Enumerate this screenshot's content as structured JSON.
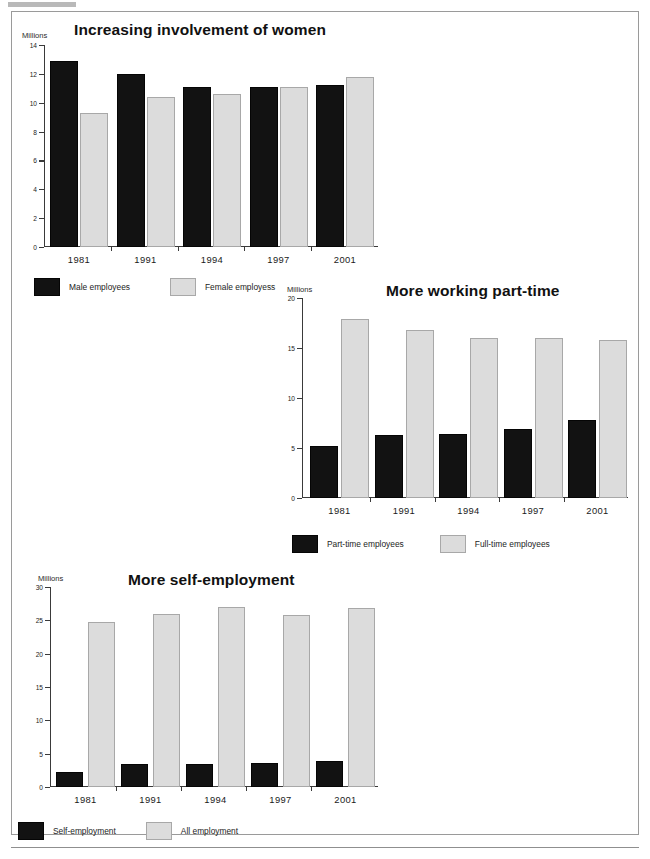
{
  "page": {
    "background_color": "#ffffff",
    "frame_color": "#9a9a9a",
    "dark_series_color": "#121212",
    "light_series_color": "#dcdcdc"
  },
  "charts": [
    {
      "title": "Increasing involvement of women",
      "unit_label": "Millions",
      "legend": [
        {
          "label": "Male employees",
          "swatch": "dark"
        },
        {
          "label": "Female employess",
          "swatch": "light"
        }
      ]
    },
    {
      "title": "More working part-time",
      "unit_label": "Millions",
      "legend": [
        {
          "label": "Part-time employees",
          "swatch": "dark"
        },
        {
          "label": "Full-time employees",
          "swatch": "light"
        }
      ]
    },
    {
      "title": "More self-employment",
      "unit_label": "Millions",
      "legend": [
        {
          "label": "Self-employment",
          "swatch": "dark"
        },
        {
          "label": "All employment",
          "swatch": "light"
        }
      ]
    }
  ],
  "chart_data": [
    {
      "type": "bar",
      "title": "Increasing involvement of women",
      "xlabel": "",
      "ylabel": "Millions",
      "ylim": [
        0,
        14
      ],
      "yticks": [
        0,
        2,
        4,
        6,
        8,
        10,
        12,
        14
      ],
      "ytick_labels": [
        "0",
        "2",
        "4",
        "6",
        "8",
        "10",
        "12",
        "14"
      ],
      "grid": false,
      "legend_position": "below",
      "categories": [
        "1981",
        "1991",
        "1994",
        "1997",
        "2001"
      ],
      "series": [
        {
          "name": "Male employees",
          "color": "#121212",
          "values": [
            12.9,
            12.0,
            11.1,
            11.1,
            11.2
          ]
        },
        {
          "name": "Female employess",
          "color": "#dcdcdc",
          "values": [
            9.3,
            10.4,
            10.6,
            11.1,
            11.8
          ]
        }
      ]
    },
    {
      "type": "bar",
      "title": "More working part-time",
      "xlabel": "",
      "ylabel": "Millions",
      "ylim": [
        0,
        20
      ],
      "yticks": [
        0,
        5,
        10,
        15,
        20
      ],
      "ytick_labels": [
        "0",
        "5",
        "10",
        "15",
        "20"
      ],
      "grid": false,
      "legend_position": "below",
      "categories": [
        "1981",
        "1991",
        "1994",
        "1997",
        "2001"
      ],
      "series": [
        {
          "name": "Part-time employees",
          "color": "#121212",
          "values": [
            5.2,
            6.3,
            6.4,
            6.9,
            7.8
          ]
        },
        {
          "name": "Full-time employees",
          "color": "#dcdcdc",
          "values": [
            17.9,
            16.8,
            16.0,
            16.0,
            15.8
          ]
        }
      ]
    },
    {
      "type": "bar",
      "title": "More self-employment",
      "xlabel": "",
      "ylabel": "Millions",
      "ylim": [
        0,
        30
      ],
      "yticks": [
        0,
        5,
        10,
        15,
        20,
        25,
        30
      ],
      "ytick_labels": [
        "0",
        "5",
        "10",
        "15",
        "20",
        "25",
        "30"
      ],
      "grid": false,
      "legend_position": "below",
      "categories": [
        "1981",
        "1991",
        "1994",
        "1997",
        "2001"
      ],
      "series": [
        {
          "name": "Self-employment",
          "color": "#121212",
          "values": [
            2.3,
            3.5,
            3.4,
            3.6,
            3.9
          ]
        },
        {
          "name": "All employment",
          "color": "#dcdcdc",
          "values": [
            24.7,
            26.0,
            27.0,
            25.8,
            26.8
          ]
        }
      ]
    }
  ]
}
